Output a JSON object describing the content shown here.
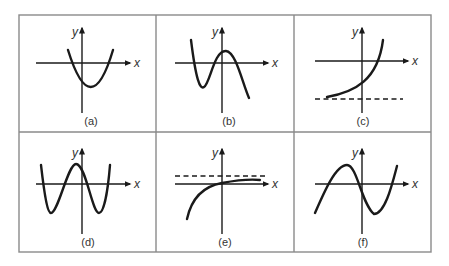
{
  "figure": {
    "grid": {
      "left": 19,
      "top": 15,
      "right": 431,
      "bottom": 252,
      "col_dividers": [
        156,
        294
      ],
      "row_divider": 132,
      "color": "#8a8a8a"
    },
    "line_color": "#1a1a1a",
    "axis_labels": {
      "x": "x",
      "y": "y"
    },
    "panels": [
      {
        "id": "a",
        "caption": "(a)",
        "description": "upward parabola, vertex below x-axis right of y-axis",
        "origin": [
          82,
          63
        ],
        "xaxis": [
          36,
          130
        ],
        "yaxis": [
          28,
          113
        ],
        "caption_pos": [
          91,
          125
        ],
        "curve": "M68,50 Q91,124 113,50",
        "dashed": null
      },
      {
        "id": "b",
        "caption": "(b)",
        "description": "cubic with local min left of y-axis and local max right of y-axis, ending downward",
        "origin": [
          222,
          63
        ],
        "xaxis": [
          175,
          268
        ],
        "yaxis": [
          28,
          113
        ],
        "caption_pos": [
          229,
          125
        ],
        "curve": "M191,40 C196,80 200,90 204,87 C210,84 214,50 226,51 C236,52 242,82 249,98",
        "dashed": null
      },
      {
        "id": "c",
        "caption": "(c)",
        "description": "exponential growth with horizontal asymptote below x-axis",
        "origin": [
          362,
          61
        ],
        "xaxis": [
          315,
          408
        ],
        "yaxis": [
          28,
          113
        ],
        "caption_pos": [
          363,
          125
        ],
        "curve": "M327,97 C355,92 378,80 383,40",
        "dashed": [
          315,
          403,
          99
        ]
      },
      {
        "id": "d",
        "caption": "(d)",
        "description": "quartic W-shape with two minima and central maximum left of y-axis",
        "origin": [
          82,
          184
        ],
        "xaxis": [
          36,
          130
        ],
        "yaxis": [
          149,
          234
        ],
        "caption_pos": [
          88,
          246
        ],
        "curve": "M41,165 C45,200 48,213 51,213 C58,213 68,164 76,164 C86,164 92,213 99,213 C104,213 108,190 110,165",
        "dashed": null
      },
      {
        "id": "e",
        "caption": "(e)",
        "description": "logarithmic-type increasing curve approaching horizontal asymptote above x-axis",
        "origin": [
          222,
          184
        ],
        "xaxis": [
          175,
          268
        ],
        "yaxis": [
          149,
          234
        ],
        "caption_pos": [
          225,
          246
        ],
        "curve": "M187,219 C192,196 205,186 222,183 C238,180 250,179 260,180",
        "dashed": [
          175,
          265,
          176
        ]
      },
      {
        "id": "f",
        "caption": "(f)",
        "description": "cubic with local max left of y-axis and local min right of y-axis, ending upward",
        "origin": [
          362,
          184
        ],
        "xaxis": [
          315,
          408
        ],
        "yaxis": [
          149,
          234
        ],
        "caption_pos": [
          363,
          246
        ],
        "curve": "M315,213 C325,190 336,165 347,165 C357,165 362,205 374,214 C385,214 392,185 397,166",
        "dashed": null
      }
    ]
  }
}
